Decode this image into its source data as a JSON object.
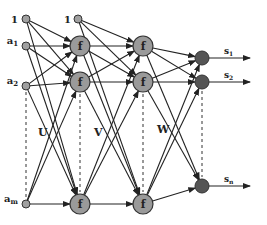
{
  "diagram": {
    "type": "neural-network",
    "colors": {
      "hidden": "#9a9a9a",
      "output": "#555555",
      "input": "#a0a0a0",
      "edge": "#222222"
    },
    "inputs": [
      {
        "label": "1",
        "x": 26,
        "y": 19
      },
      {
        "label": "a1",
        "x": 26,
        "y": 46
      },
      {
        "label": "a2",
        "x": 26,
        "y": 86
      },
      {
        "label": "am",
        "x": 26,
        "y": 204
      }
    ],
    "hidden1_bias": {
      "label": "1",
      "x": 78,
      "y": 19
    },
    "hidden1": [
      {
        "label": "f",
        "x": 80,
        "y": 46
      },
      {
        "label": "f",
        "x": 80,
        "y": 82
      },
      {
        "label": "f",
        "x": 80,
        "y": 204
      }
    ],
    "hidden2": [
      {
        "label": "f",
        "x": 143,
        "y": 46
      },
      {
        "label": "f",
        "x": 143,
        "y": 82
      },
      {
        "label": "f",
        "x": 143,
        "y": 204
      }
    ],
    "outputs": [
      {
        "label": "s1",
        "x": 202,
        "y": 58
      },
      {
        "label": "s2",
        "x": 202,
        "y": 82
      },
      {
        "label": "sn",
        "x": 202,
        "y": 186
      }
    ],
    "weights": [
      {
        "label": "U",
        "x": 38,
        "y": 136
      },
      {
        "label": "V",
        "x": 94,
        "y": 136
      },
      {
        "label": "W",
        "x": 157,
        "y": 133
      }
    ]
  }
}
